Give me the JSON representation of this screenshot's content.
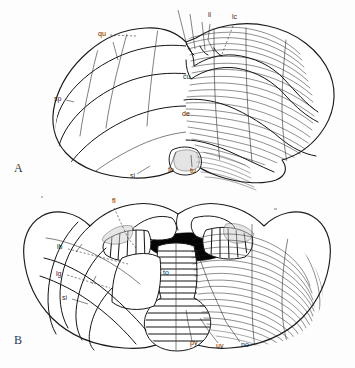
{
  "figure": {
    "background_color": "#fdfdfd",
    "ink_color": "#1a1a1a",
    "panels": [
      {
        "letter": "A",
        "view": "superior-view",
        "letter_x": 14,
        "letter_y": 172
      },
      {
        "letter": "B",
        "view": "inferior-view",
        "letter_x": 14,
        "letter_y": 344
      }
    ]
  },
  "panel_a": {
    "labels": [
      {
        "id": "qu",
        "text": "qu",
        "x": 98,
        "y": 36
      },
      {
        "id": "li",
        "text": "li",
        "x": 208,
        "y": 17
      },
      {
        "id": "lc",
        "text": "lc",
        "x": 232,
        "y": 19
      },
      {
        "id": "sp",
        "text": "sp",
        "x": 54,
        "y": 101
      },
      {
        "id": "cu",
        "text": "cu",
        "x": 183,
        "y": 79
      },
      {
        "id": "de",
        "text": "de",
        "x": 182,
        "y": 116
      },
      {
        "id": "si",
        "text": "si",
        "x": 130,
        "y": 178
      },
      {
        "id": "fo",
        "text": "fo",
        "x": 168,
        "y": 172
      },
      {
        "id": "tu",
        "text": "tu",
        "x": 190,
        "y": 173
      }
    ]
  },
  "panel_b": {
    "labels": [
      {
        "id": "fl",
        "text": "fl",
        "x": 112,
        "y": 203
      },
      {
        "id": "lb",
        "text": "lb",
        "x": 57,
        "y": 249
      },
      {
        "id": "lg",
        "text": "lg",
        "x": 56,
        "y": 276
      },
      {
        "id": "si",
        "text": "si",
        "x": 62,
        "y": 300
      },
      {
        "id": "to",
        "text": "to",
        "x": 163,
        "y": 275
      },
      {
        "id": "py",
        "text": "py",
        "x": 190,
        "y": 345
      },
      {
        "id": "uv",
        "text": "uv",
        "x": 216,
        "y": 348
      },
      {
        "id": "no",
        "text": "no",
        "x": 241,
        "y": 347
      }
    ]
  }
}
